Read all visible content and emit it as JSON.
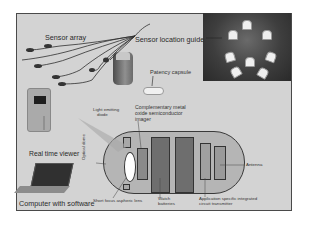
{
  "figure": {
    "labels": {
      "sensor_array": "Sensor array",
      "sensor_location_guide": "Sensor location guide",
      "patency_capsule": "Patency capsule",
      "light_emitting_diode": "Light emitting diode",
      "cmos_imager": "Complementary metal oxide semiconductor imager",
      "cmos_line1": "Complementary metal",
      "cmos_line2": "oxide semiconductor",
      "cmos_line3": "imager",
      "led_line1": "Light emitting",
      "led_line2": "diode",
      "real_time_viewer": "Real time viewer",
      "computer_with_software": "Computer with software",
      "optical_dome": "Optical dome",
      "short_focus_lens": "Short focus aspheric lens",
      "watch_batteries_line1": "Watch",
      "watch_batteries_line2": "batteries",
      "asic_line1": "Application specific  integrated",
      "asic_line2": "circuit  transmitter",
      "antenna": "Antenna"
    },
    "colors": {
      "panel_bg": "#d3d3d3",
      "frame_border": "#4a4a4a",
      "capsule_fill": "#b5b5b5",
      "battery_fill": "#6e6e6e",
      "lens_fill": "#ffffff",
      "torso_dark": "#2a2a2a"
    }
  }
}
